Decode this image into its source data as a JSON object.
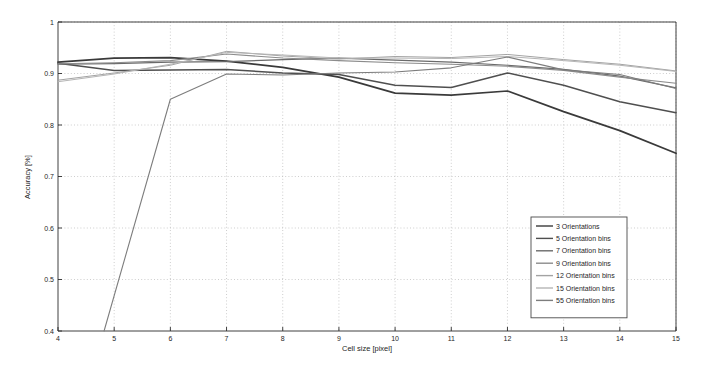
{
  "chart_data": {
    "type": "line",
    "title": "",
    "xlabel": "Cell size [pixel]",
    "ylabel": "Accuracy [%]",
    "xlim": [
      4,
      15
    ],
    "ylim": [
      0.4,
      1
    ],
    "xticks": [
      4,
      5,
      6,
      7,
      8,
      9,
      10,
      11,
      12,
      13,
      14,
      15
    ],
    "yticks": [
      0.4,
      0.5,
      0.6,
      0.7,
      0.8,
      0.9,
      1
    ],
    "xtick_labels": [
      "4",
      "5",
      "6",
      "7",
      "8",
      "9",
      "10",
      "11",
      "12",
      "13",
      "14",
      "15"
    ],
    "ytick_labels": [
      "0.4",
      "0.5",
      "0.6",
      "0.7",
      "0.8",
      "0.9",
      "1"
    ],
    "grid": true,
    "legend_position": "lower right",
    "x": [
      4,
      5,
      6,
      7,
      8,
      9,
      10,
      11,
      12,
      13,
      14,
      15
    ],
    "series": [
      {
        "name": "3 Orientations",
        "color": "#3a3a3a",
        "width": 1.7,
        "values": [
          0.922,
          0.93,
          0.931,
          0.924,
          0.912,
          0.893,
          0.862,
          0.858,
          0.866,
          0.826,
          0.789,
          0.745
        ]
      },
      {
        "name": "5 Orientation bins",
        "color": "#4f4f4f",
        "width": 1.5,
        "values": [
          0.92,
          0.906,
          0.907,
          0.908,
          0.901,
          0.898,
          0.877,
          0.873,
          0.901,
          0.877,
          0.845,
          0.824
        ]
      },
      {
        "name": "7 Orientation bins",
        "color": "#6a6a6a",
        "width": 1.2,
        "values": [
          0.918,
          0.919,
          0.922,
          0.923,
          0.927,
          0.93,
          0.926,
          0.922,
          0.916,
          0.908,
          0.895,
          0.872
        ]
      },
      {
        "name": "9 Orientation bins",
        "color": "#8c8c8c",
        "width": 1.1,
        "values": [
          0.919,
          0.921,
          0.925,
          0.938,
          0.93,
          0.925,
          0.921,
          0.918,
          0.914,
          0.906,
          0.893,
          0.881
        ]
      },
      {
        "name": "12 Orientation bins",
        "color": "#a3a3a3",
        "width": 1.0,
        "values": [
          0.887,
          0.901,
          0.916,
          0.943,
          0.934,
          0.928,
          0.933,
          0.931,
          0.937,
          0.927,
          0.918,
          0.905
        ]
      },
      {
        "name": "15 Orientation bins",
        "color": "#b5b5b5",
        "width": 1.0,
        "values": [
          0.884,
          0.899,
          0.918,
          0.941,
          0.936,
          0.93,
          0.93,
          0.929,
          0.933,
          0.925,
          0.916,
          0.904
        ]
      },
      {
        "name": "55 Orientation bins",
        "color": "#7d7d7d",
        "width": 1.1,
        "values": [
          null,
          0.4,
          0.85,
          0.899,
          0.897,
          0.901,
          0.903,
          0.911,
          0.932,
          0.907,
          0.898,
          0.871
        ],
        "clipped_start_x": 4.82,
        "note": "rises off the bottom of the axis between x=4.8 and x=6"
      }
    ]
  },
  "legend": {
    "items": [
      "3 Orientations",
      "5 Orientation bins",
      "7 Orientation bins",
      "9 Orientation bins",
      "12 Orientation bins",
      "15 Orientation bins",
      "55 Orientation bins"
    ]
  }
}
